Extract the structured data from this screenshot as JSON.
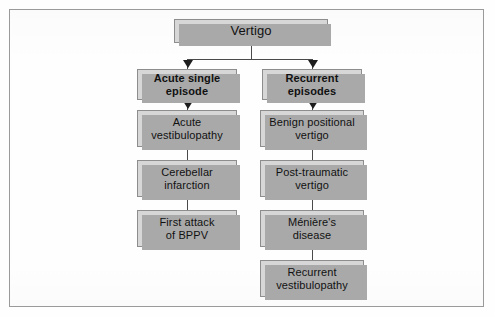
{
  "figure": {
    "type": "flowchart",
    "orientation": "top-down",
    "colors": {
      "node_fill": "#d7d7d7",
      "node_border": "#8d8d8d",
      "node_shadow": "#a9a9a9",
      "connector": "#4a4a4a",
      "arrowhead": "#1d1d1d",
      "frame": "#9a9a9a",
      "background": "#fefefe"
    }
  },
  "nodes": {
    "root": {
      "label": "Vertigo"
    },
    "branch_left": {
      "label": "Acute single\nepisode"
    },
    "branch_right": {
      "label": "Recurrent\nepisodes"
    },
    "left_1": {
      "label": "Acute\nvestibulopathy"
    },
    "left_2": {
      "label": "Cerebellar\ninfarction"
    },
    "left_3": {
      "label": "First attack\nof BPPV"
    },
    "right_1": {
      "label": "Benign positional\nvertigo"
    },
    "right_2": {
      "label": "Post-traumatic\nvertigo"
    },
    "right_3": {
      "label": "Ménière's\ndisease"
    },
    "right_4": {
      "label": "Recurrent\nvestibulopathy"
    }
  },
  "edges": [
    {
      "from": "root",
      "to": "branch_left",
      "arrow": true
    },
    {
      "from": "root",
      "to": "branch_right",
      "arrow": true
    },
    {
      "from": "branch_left",
      "to": "left_1",
      "arrow": true
    },
    {
      "from": "branch_right",
      "to": "right_1",
      "arrow": true
    },
    {
      "from": "left_1",
      "to": "left_2",
      "arrow": false
    },
    {
      "from": "left_2",
      "to": "left_3",
      "arrow": false
    },
    {
      "from": "right_1",
      "to": "right_2",
      "arrow": false
    },
    {
      "from": "right_2",
      "to": "right_3",
      "arrow": false
    },
    {
      "from": "right_3",
      "to": "right_4",
      "arrow": false
    }
  ]
}
